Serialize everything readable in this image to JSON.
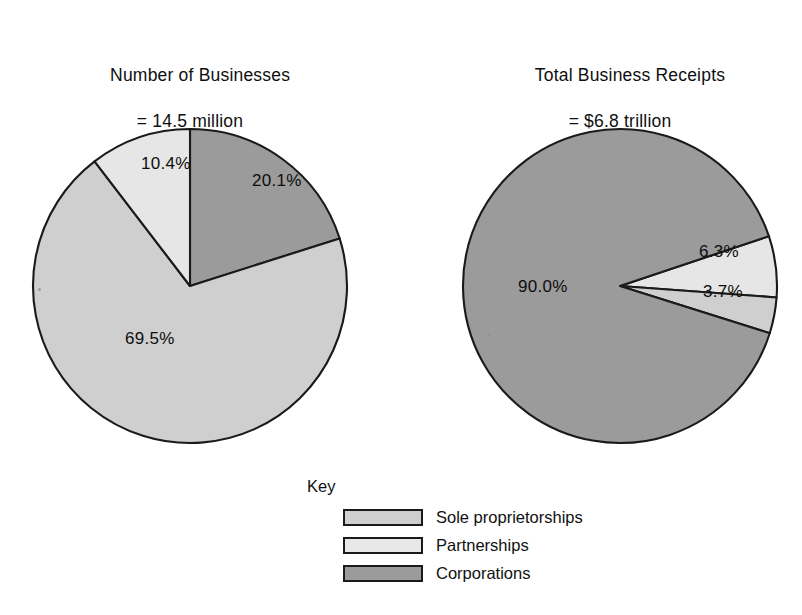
{
  "chart_data": [
    {
      "type": "pie",
      "title": "Number of Businesses",
      "subtitle": "= 14.5 million",
      "total_label": "14.5 million",
      "categories": [
        "Corporations",
        "Sole proprietorships",
        "Partnerships"
      ],
      "values": [
        20.1,
        69.5,
        10.4
      ],
      "labels": [
        "20.1%",
        "69.5%",
        "10.4%"
      ],
      "colors": [
        "#9b9b9b",
        "#cfcfcf",
        "#e6e6e6"
      ],
      "start_angle_deg": 0,
      "direction": "clockwise",
      "legend_position": "bottom-center"
    },
    {
      "type": "pie",
      "title": "Total Business Receipts",
      "subtitle": "= $6.8 trillion",
      "total_label": "$6.8 trillion",
      "categories": [
        "Partnerships",
        "Sole proprietorships",
        "Corporations"
      ],
      "values": [
        6.3,
        3.7,
        90.0
      ],
      "labels": [
        "6.3%",
        "3.7%",
        "90.0%"
      ],
      "colors": [
        "#e6e6e6",
        "#cfcfcf",
        "#9b9b9b"
      ],
      "start_angle_deg": 71.64,
      "direction": "clockwise",
      "legend_position": "bottom-center"
    }
  ],
  "left_chart": {
    "title_line1": "Number of Businesses",
    "title_line2": "= 14.5 million",
    "slices": [
      {
        "label": "20.1%",
        "value": 20.1,
        "key": "Corporations",
        "color": "#9b9b9b",
        "label_x": 252,
        "label_y": 186
      },
      {
        "label": "69.5%",
        "value": 69.5,
        "key": "Sole proprietorships",
        "color": "#cfcfcf",
        "label_x": 125,
        "label_y": 344
      },
      {
        "label": "10.4%",
        "value": 10.4,
        "key": "Partnerships",
        "color": "#e6e6e6",
        "label_x": 141,
        "label_y": 169
      }
    ]
  },
  "right_chart": {
    "title_line1": "Total Business Receipts",
    "title_line2": "= $6.8 trillion",
    "slices": [
      {
        "label": "6.3%",
        "value": 6.3,
        "key": "Partnerships",
        "color": "#e6e6e6",
        "label_x": 699,
        "label_y": 257
      },
      {
        "label": "3.7%",
        "value": 3.7,
        "key": "Sole proprietorships",
        "color": "#cfcfcf",
        "label_x": 703,
        "label_y": 297
      },
      {
        "label": "90.0%",
        "value": 90.0,
        "key": "Corporations",
        "color": "#9b9b9b",
        "label_x": 518,
        "label_y": 292
      }
    ]
  },
  "legend": {
    "title": "Key",
    "items": [
      {
        "label": "Sole proprietorships",
        "color": "#cfcfcf"
      },
      {
        "label": "Partnerships",
        "color": "#e8e8e8"
      },
      {
        "label": "Corporations",
        "color": "#9b9b9b"
      }
    ]
  },
  "style": {
    "background": "#ffffff",
    "outline": "#1a1a1a",
    "text": "#111111"
  }
}
